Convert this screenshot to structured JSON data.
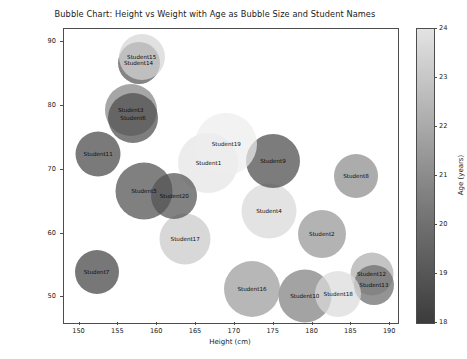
{
  "chart_data": {
    "type": "scatter",
    "title": "Bubble Chart: Height vs Weight with Age as Bubble Size and Student Names",
    "xlabel": "Height (cm)",
    "ylabel": "Weight (kg)",
    "xlim": [
      148,
      191
    ],
    "ylim": [
      46,
      92
    ],
    "xticks": [
      150,
      155,
      160,
      165,
      170,
      175,
      180,
      185,
      190
    ],
    "yticks": [
      50,
      60,
      70,
      80,
      90
    ],
    "grid": false,
    "legend": "none",
    "colorbar": {
      "label": "Age (years)",
      "min": 18,
      "max": 24,
      "ticks": [
        18,
        19,
        20,
        21,
        22,
        23,
        24
      ],
      "colormap": "grayscale-dark-to-light"
    },
    "size_encodes": "Age (years)",
    "color_encodes": "Age (years)",
    "points": [
      {
        "name": "Student1",
        "height": 166.6,
        "weight": 71.0,
        "age": 23.6,
        "size": 60
      },
      {
        "name": "Student2",
        "height": 181.2,
        "weight": 60.0,
        "age": 21.0,
        "size": 48
      },
      {
        "name": "Student3",
        "height": 156.6,
        "weight": 79.3,
        "age": 20.4,
        "size": 52
      },
      {
        "name": "Student4",
        "height": 174.4,
        "weight": 63.5,
        "age": 23.2,
        "size": 55
      },
      {
        "name": "Student5",
        "height": 158.3,
        "weight": 66.6,
        "age": 18.7,
        "size": 57
      },
      {
        "name": "Student6",
        "height": 156.9,
        "weight": 78.0,
        "age": 18.6,
        "size": 50
      },
      {
        "name": "Student7",
        "height": 152.2,
        "weight": 54.0,
        "age": 18.3,
        "size": 44
      },
      {
        "name": "Student8",
        "height": 185.6,
        "weight": 69.0,
        "age": 20.7,
        "size": 44
      },
      {
        "name": "Student9",
        "height": 174.9,
        "weight": 71.3,
        "age": 18.5,
        "size": 54
      },
      {
        "name": "Student10",
        "height": 179.0,
        "weight": 50.3,
        "age": 20.3,
        "size": 53
      },
      {
        "name": "Student11",
        "height": 152.4,
        "weight": 72.4,
        "age": 18.4,
        "size": 45
      },
      {
        "name": "Student12",
        "height": 187.6,
        "weight": 53.6,
        "age": 21.8,
        "size": 43
      },
      {
        "name": "Student13",
        "height": 187.9,
        "weight": 52.0,
        "age": 19.6,
        "size": 40
      },
      {
        "name": "Student14",
        "height": 157.6,
        "weight": 86.7,
        "age": 18.9,
        "size": 42
      },
      {
        "name": "Student15",
        "height": 158.0,
        "weight": 87.6,
        "age": 23.1,
        "size": 46
      },
      {
        "name": "Student16",
        "height": 172.2,
        "weight": 51.3,
        "age": 21.2,
        "size": 56
      },
      {
        "name": "Student17",
        "height": 163.6,
        "weight": 59.2,
        "age": 22.7,
        "size": 51
      },
      {
        "name": "Student18",
        "height": 183.3,
        "weight": 50.6,
        "age": 23.3,
        "size": 46
      },
      {
        "name": "Student19",
        "height": 168.9,
        "weight": 74.0,
        "age": 23.9,
        "size": 62
      },
      {
        "name": "Student20",
        "height": 162.2,
        "weight": 65.8,
        "age": 18.8,
        "size": 46
      }
    ]
  }
}
